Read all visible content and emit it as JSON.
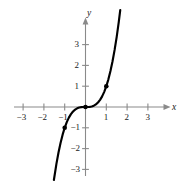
{
  "chart_data": {
    "type": "line",
    "title": "",
    "xlabel": "x",
    "ylabel": "y",
    "function": "y = x^3",
    "xlim": [
      -3.5,
      3.5
    ],
    "ylim": [
      -3.5,
      3.5
    ],
    "grid": false,
    "legend": null,
    "axis_color": "#8a8a8a",
    "curve_color": "#000000",
    "point_color": "#000000",
    "xticks": [
      -3,
      -2,
      -1,
      1,
      2,
      3
    ],
    "yticks": [
      -3,
      -2,
      -1,
      1,
      2,
      3
    ],
    "xtick_labels": [
      "−3",
      "−2",
      "−1",
      "1",
      "2",
      "3"
    ],
    "ytick_labels": [
      "−3",
      "−2",
      "−1",
      "1",
      "2",
      "3"
    ],
    "x": [
      -1.52,
      -1.4,
      -1.3,
      -1.2,
      -1.1,
      -1.0,
      -0.9,
      -0.8,
      -0.7,
      -0.6,
      -0.5,
      -0.4,
      -0.3,
      -0.2,
      -0.1,
      0.0,
      0.1,
      0.2,
      0.3,
      0.4,
      0.5,
      0.6,
      0.7,
      0.8,
      0.9,
      1.0,
      1.1,
      1.2,
      1.3,
      1.4,
      1.5,
      1.6,
      1.67
    ],
    "y": [
      -3.51,
      -2.744,
      -2.197,
      -1.728,
      -1.331,
      -1.0,
      -0.729,
      -0.512,
      -0.343,
      -0.216,
      -0.125,
      -0.064,
      -0.027,
      -0.008,
      -0.001,
      0.0,
      0.001,
      0.008,
      0.027,
      0.064,
      0.125,
      0.216,
      0.343,
      0.512,
      0.729,
      1.0,
      1.331,
      1.728,
      2.197,
      2.744,
      3.375,
      4.096,
      4.657
    ],
    "marked_points": [
      {
        "x": -1,
        "y": -1
      },
      {
        "x": 0,
        "y": 0
      },
      {
        "x": 1,
        "y": 1
      }
    ]
  },
  "axis_labels": {
    "x": "x",
    "y": "y"
  }
}
